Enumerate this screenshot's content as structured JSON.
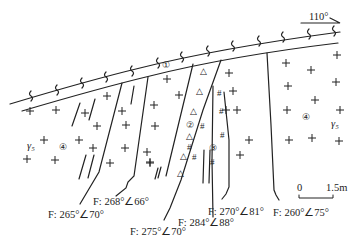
{
  "diagram": {
    "type": "geological-cross-section",
    "orientation": {
      "label": "110°",
      "arrow": "right"
    },
    "scale_bar": {
      "start": "0",
      "end": "1.5m"
    },
    "zones": [
      {
        "id": "1",
        "label": "①",
        "description": "schist/mylonite band (wavy symbol)"
      },
      {
        "id": "2",
        "label": "②",
        "description": "breccia zone (triangle symbol)"
      },
      {
        "id": "3",
        "label": "③",
        "description": "altered zone (# symbol)"
      },
      {
        "id": "4",
        "label": "④",
        "description": "granite (+ symbol)"
      }
    ],
    "rock_code": {
      "left": "γ₅",
      "right": "γ₅"
    },
    "faults": [
      {
        "label": "F: 265°∠70°"
      },
      {
        "label": "F: 268°∠66°"
      },
      {
        "label": "F: 275°∠70°"
      },
      {
        "label": "F: 284°∠88°"
      },
      {
        "label": "F: 270°∠81°"
      },
      {
        "label": "F: 260°∠75°"
      }
    ]
  }
}
